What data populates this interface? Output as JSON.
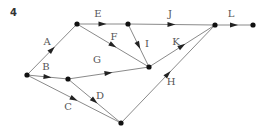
{
  "figure_number": "4",
  "nodes": [
    {
      "id": "n1",
      "x": 27,
      "y": 75
    },
    {
      "id": "n2",
      "x": 77,
      "y": 24
    },
    {
      "id": "n3",
      "x": 128,
      "y": 24
    },
    {
      "id": "n4",
      "x": 68,
      "y": 79
    },
    {
      "id": "n5",
      "x": 149,
      "y": 67
    },
    {
      "id": "n6",
      "x": 121,
      "y": 123
    },
    {
      "id": "n7",
      "x": 215,
      "y": 25
    },
    {
      "id": "n8",
      "x": 253,
      "y": 25
    }
  ],
  "edges": [
    {
      "label": "A",
      "from": "n1",
      "to": "n2",
      "lx": 47,
      "ly": 45
    },
    {
      "label": "B",
      "from": "n1",
      "to": "n4",
      "lx": 46,
      "ly": 70
    },
    {
      "label": "C",
      "from": "n1",
      "to": "n6",
      "lx": 68,
      "ly": 110
    },
    {
      "label": "D",
      "from": "n4",
      "to": "n6",
      "lx": 100,
      "ly": 99
    },
    {
      "label": "E",
      "from": "n2",
      "to": "n3",
      "lx": 98,
      "ly": 17
    },
    {
      "label": "F",
      "from": "n2",
      "to": "n5",
      "lx": 114,
      "ly": 40
    },
    {
      "label": "G",
      "from": "n4",
      "to": "n5",
      "lx": 97,
      "ly": 63
    },
    {
      "label": "I",
      "from": "n3",
      "to": "n5",
      "lx": 147,
      "ly": 47
    },
    {
      "label": "J",
      "from": "n3",
      "to": "n7",
      "lx": 170,
      "ly": 17
    },
    {
      "label": "K",
      "from": "n5",
      "to": "n7",
      "lx": 176,
      "ly": 45
    },
    {
      "label": "H",
      "from": "n6",
      "to": "n7",
      "lx": 171,
      "ly": 85
    },
    {
      "label": "L",
      "from": "n7",
      "to": "n8",
      "lx": 231,
      "ly": 17
    }
  ]
}
